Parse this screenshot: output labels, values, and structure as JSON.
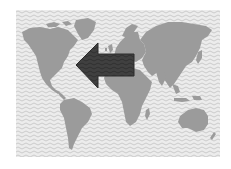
{
  "map": {
    "type": "world-map",
    "style": "grayscale",
    "colors": {
      "page_background": "#ffffff",
      "ocean_background": "#e8e8e8",
      "wave_pattern": "#c9c9c9",
      "land": "#9b9b9b",
      "arrow_fill": "#3f3f3f",
      "arrow_stroke": "#2c2c2c"
    },
    "regions": [
      {
        "name": "north-america"
      },
      {
        "name": "greenland"
      },
      {
        "name": "south-america"
      },
      {
        "name": "europe"
      },
      {
        "name": "africa"
      },
      {
        "name": "asia"
      },
      {
        "name": "australia"
      },
      {
        "name": "new-zealand"
      },
      {
        "name": "madagascar"
      },
      {
        "name": "japan"
      },
      {
        "name": "uk-ireland"
      }
    ],
    "annotation": {
      "type": "arrow",
      "direction": "west",
      "from": "europe",
      "to": "north-america-east-coast"
    }
  }
}
